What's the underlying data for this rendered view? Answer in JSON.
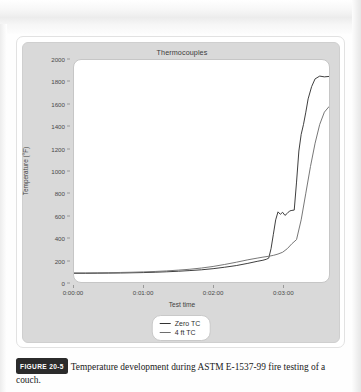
{
  "figure": {
    "badge_label": "FIGURE 20-5",
    "caption_text": "Temperature development during ASTM E-1537-99 fire testing of a couch."
  },
  "chart_data": {
    "type": "line",
    "title": "Thermocouples",
    "xlabel": "Test time",
    "ylabel": "Temperature (°F)",
    "grid": false,
    "legend_position": "bottom-center",
    "ylim": [
      0,
      2000
    ],
    "ytick_labels": [
      "2000",
      "1800",
      "1600",
      "1400",
      "1200",
      "1000",
      "800",
      "600",
      "400",
      "200",
      "0"
    ],
    "ytick_values": [
      2000,
      1800,
      1600,
      1400,
      1200,
      1000,
      800,
      600,
      400,
      200,
      0
    ],
    "xlim_seconds": [
      0,
      220
    ],
    "xtick_labels": [
      "0:00:00",
      "0:01:00",
      "0:02:00",
      "0:03:00"
    ],
    "xtick_values": [
      0,
      60,
      120,
      180
    ],
    "series": [
      {
        "name": "Zero TC",
        "color": "#333333",
        "x": [
          0,
          10,
          20,
          30,
          40,
          50,
          60,
          70,
          80,
          90,
          100,
          110,
          120,
          130,
          140,
          150,
          158,
          163,
          166,
          168,
          170,
          172,
          174,
          176,
          178,
          180,
          182,
          184,
          186,
          188,
          190,
          192,
          194,
          196,
          198,
          200,
          202,
          205,
          208,
          212,
          216,
          220
        ],
        "y": [
          78,
          78,
          79,
          80,
          81,
          83,
          85,
          88,
          92,
          97,
          103,
          110,
          120,
          133,
          148,
          168,
          186,
          196,
          205,
          215,
          300,
          430,
          560,
          632,
          610,
          628,
          600,
          618,
          640,
          645,
          648,
          900,
          1180,
          1330,
          1420,
          1530,
          1650,
          1760,
          1830,
          1855,
          1848,
          1852
        ]
      },
      {
        "name": "4 ft TC",
        "color": "#6e6e6e",
        "x": [
          0,
          10,
          20,
          30,
          40,
          50,
          60,
          70,
          80,
          90,
          100,
          110,
          120,
          130,
          140,
          150,
          158,
          163,
          168,
          172,
          176,
          180,
          184,
          188,
          192,
          196,
          200,
          204,
          208,
          212,
          216,
          220
        ],
        "y": [
          82,
          82,
          83,
          84,
          86,
          88,
          91,
          95,
          100,
          107,
          115,
          126,
          140,
          158,
          178,
          200,
          215,
          224,
          232,
          240,
          252,
          268,
          300,
          345,
          382,
          560,
          800,
          1040,
          1250,
          1420,
          1530,
          1580
        ]
      }
    ]
  }
}
